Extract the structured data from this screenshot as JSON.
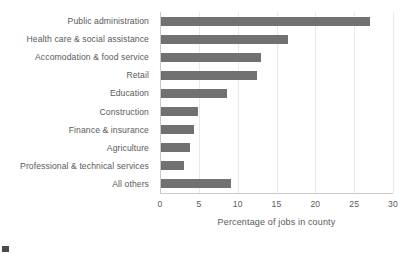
{
  "chart_data": {
    "type": "bar",
    "orientation": "horizontal",
    "title": "",
    "xlabel": "Percentage of jobs in county",
    "ylabel": "",
    "xlim": [
      0,
      30
    ],
    "xticks": [
      0,
      5,
      10,
      15,
      20,
      25,
      30
    ],
    "xtick_labels": [
      "0",
      "5",
      "10",
      "15",
      "20",
      "25",
      "30"
    ],
    "grid": true,
    "legend": false,
    "bar_color": "#717171",
    "categories": [
      "Public administration",
      "Health care & social assistance",
      "Accomodation & food service",
      "Retail",
      "Education",
      "Construction",
      "Finance & insurance",
      "Agriculture",
      "Professional & technical services",
      "All others"
    ],
    "values": [
      27.0,
      16.5,
      13.0,
      12.5,
      8.6,
      4.9,
      4.4,
      3.9,
      3.1,
      9.2
    ]
  }
}
